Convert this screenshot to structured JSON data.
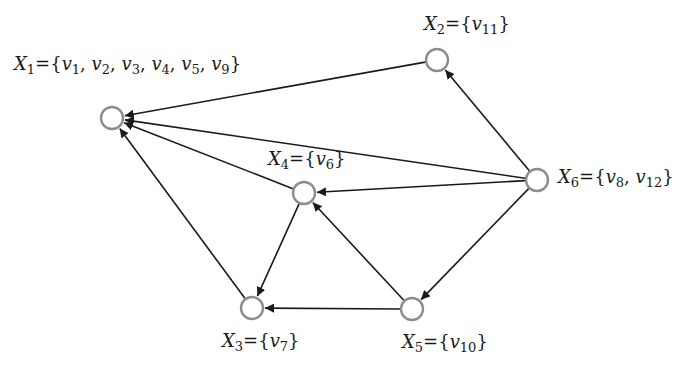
{
  "colors": {
    "node_stroke": "#8c8c8c",
    "node_fill": "#ffffff",
    "edge": "#1a1a1a",
    "text": "#1a1a1a"
  },
  "nodes": [
    {
      "id": "X1",
      "cx": 112,
      "cy": 118,
      "label": "X1={v1, v2, v3, v4, v5, v9}",
      "set": [
        "v1",
        "v2",
        "v3",
        "v4",
        "v5",
        "v9"
      ],
      "label_x": 14,
      "label_y": 55
    },
    {
      "id": "X2",
      "cx": 437,
      "cy": 60,
      "label": "X2={v11}",
      "set": [
        "v11"
      ],
      "label_x": 424,
      "label_y": 15
    },
    {
      "id": "X4",
      "cx": 304,
      "cy": 193,
      "label": "X4={v6}",
      "set": [
        "v6"
      ],
      "label_x": 268,
      "label_y": 150
    },
    {
      "id": "X6",
      "cx": 537,
      "cy": 180,
      "label": "X6={v8, v12}",
      "set": [
        "v8",
        "v12"
      ],
      "label_x": 558,
      "label_y": 168
    },
    {
      "id": "X3",
      "cx": 252,
      "cy": 308,
      "label": "X3={v7}",
      "set": [
        "v7"
      ],
      "label_x": 222,
      "label_y": 332
    },
    {
      "id": "X5",
      "cx": 412,
      "cy": 309,
      "label": "X5={v10}",
      "set": [
        "v10"
      ],
      "label_x": 402,
      "label_y": 333
    }
  ],
  "edges": [
    {
      "from": "X2",
      "to": "X1"
    },
    {
      "from": "X6",
      "to": "X1"
    },
    {
      "from": "X4",
      "to": "X1"
    },
    {
      "from": "X3",
      "to": "X1"
    },
    {
      "from": "X6",
      "to": "X2"
    },
    {
      "from": "X6",
      "to": "X4"
    },
    {
      "from": "X6",
      "to": "X5"
    },
    {
      "from": "X4",
      "to": "X3"
    },
    {
      "from": "X5",
      "to": "X4"
    },
    {
      "from": "X5",
      "to": "X3"
    }
  ],
  "labels": {
    "X1": {
      "name": "X",
      "sub": "1",
      "eq": "={",
      "items": [
        [
          "v",
          "1"
        ],
        [
          "v",
          "2"
        ],
        [
          "v",
          "3"
        ],
        [
          "v",
          "4"
        ],
        [
          "v",
          "5"
        ],
        [
          "v",
          "9"
        ]
      ],
      "close": "}"
    },
    "X2": {
      "name": "X",
      "sub": "2",
      "eq": "={",
      "items": [
        [
          "v",
          "11"
        ]
      ],
      "close": "}"
    },
    "X3": {
      "name": "X",
      "sub": "3",
      "eq": "={",
      "items": [
        [
          "v",
          "7"
        ]
      ],
      "close": "}"
    },
    "X4": {
      "name": "X",
      "sub": "4",
      "eq": "={",
      "items": [
        [
          "v",
          "6"
        ]
      ],
      "close": "}"
    },
    "X5": {
      "name": "X",
      "sub": "5",
      "eq": "={",
      "items": [
        [
          "v",
          "10"
        ]
      ],
      "close": "}"
    },
    "X6": {
      "name": "X",
      "sub": "6",
      "eq": "={",
      "items": [
        [
          "v",
          "8"
        ],
        [
          "v",
          "12"
        ]
      ],
      "close": "}"
    }
  },
  "node_radius": 11
}
